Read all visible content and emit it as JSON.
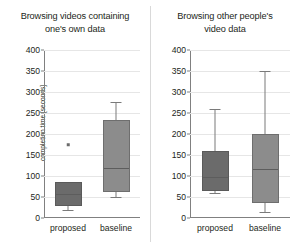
{
  "chart_data": [
    {
      "type": "box",
      "panel": "left",
      "title_line1": "Browsing videos containing",
      "title_line2": "one's own data",
      "xlabel": "",
      "ylabel": "completion time [seconds]",
      "ylim": [
        0,
        400
      ],
      "yticks": [
        0,
        50,
        100,
        150,
        200,
        250,
        300,
        350,
        400
      ],
      "ytick_labels": [
        "0",
        "50",
        "100",
        "150",
        "200",
        "250",
        "300",
        "350",
        "400"
      ],
      "grid": true,
      "categories": [
        "proposed",
        "baseline"
      ],
      "boxes": [
        {
          "name": "proposed",
          "whisker_low": 18,
          "q1": 28,
          "median": 60,
          "q3": 86,
          "whisker_high": 86,
          "outliers": [
            180
          ]
        },
        {
          "name": "baseline",
          "whisker_low": 50,
          "q1": 63,
          "median": 122,
          "q3": 234,
          "whisker_high": 276,
          "outliers": []
        }
      ]
    },
    {
      "type": "box",
      "panel": "right",
      "title_line1": "Browsing other people's",
      "title_line2": "video data",
      "xlabel": "",
      "ylabel": "",
      "ylim": [
        0,
        400
      ],
      "yticks": [
        0,
        50,
        100,
        150,
        200,
        250,
        300,
        350,
        400
      ],
      "ytick_labels": [
        "0",
        "50",
        "100",
        "150",
        "200",
        "250",
        "300",
        "350",
        "400"
      ],
      "grid": true,
      "categories": [
        "proposed",
        "baseline"
      ],
      "boxes": [
        {
          "name": "proposed",
          "whisker_low": 60,
          "q1": 65,
          "median": 100,
          "q3": 160,
          "whisker_high": 260,
          "outliers": []
        },
        {
          "name": "baseline",
          "whisker_low": 15,
          "q1": 35,
          "median": 120,
          "q3": 200,
          "whisker_high": 350,
          "outliers": []
        }
      ]
    }
  ],
  "colors": {
    "box_fill_dark": "#6b6b6b",
    "box_fill_light": "#8c8c8c",
    "gridline": "#e6e6e6",
    "axis": "#808080",
    "text": "#231f20",
    "background": "#ffffff"
  }
}
